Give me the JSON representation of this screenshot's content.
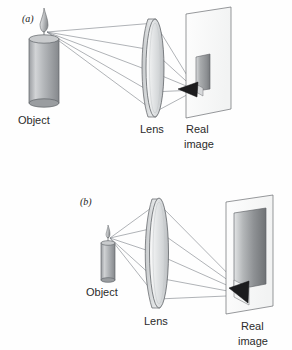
{
  "figure": {
    "background_color": "#fefefe",
    "ray_color": "#7a7f87",
    "outline_color": "#55585c",
    "panels": [
      {
        "id": "a",
        "label": "(a)",
        "object_label": "Object",
        "lens_label": "Lens",
        "image_label_line1": "Real",
        "image_label_line2": "image",
        "description": "Object far from lens, small inverted real image on screen",
        "ray_count": 5
      },
      {
        "id": "b",
        "label": "(b)",
        "object_label": "Object",
        "lens_label": "Lens",
        "image_label_line1": "Real",
        "image_label_line2": "image",
        "description": "Object close to lens, large inverted real image on distant screen",
        "ray_count": 5
      }
    ]
  }
}
